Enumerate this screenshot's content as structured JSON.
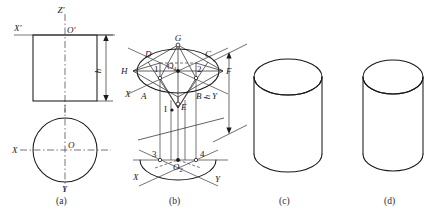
{
  "figure": {
    "kind": "engineering-drawing",
    "background_color": "#ffffff",
    "line_color": "#1a1a1a",
    "thin_line_color": "#3a3a3a"
  },
  "captions": {
    "a": "(a)",
    "b": "(b)",
    "c": "(c)",
    "d": "(d)"
  },
  "panel_a": {
    "name": "orthographic-projection",
    "axis_labels": {
      "z_prime": "Z'",
      "x_prime": "X'",
      "o_prime": "O'",
      "x": "X",
      "y": "Y",
      "o": "O"
    },
    "dimension_label": "h"
  },
  "panel_b": {
    "name": "isometric-construction",
    "axis_labels": {
      "x_upper": "X",
      "y_upper": "Y",
      "x_lower": "X",
      "y_lower": "Y"
    },
    "point_labels": {
      "G": "G",
      "C": "C",
      "D": "D",
      "H": "H",
      "F": "F",
      "A": "A",
      "B": "B",
      "E": "E",
      "I": "I",
      "one": "1",
      "two": "2",
      "three": "3",
      "four": "4",
      "o1": "O",
      "o1_sub": "1",
      "o2": "O",
      "o2_sub": "2"
    },
    "dimension_label": "h"
  },
  "panel_c": {
    "name": "isometric-cylinder-thin",
    "label": "(c)"
  },
  "panel_d": {
    "name": "isometric-cylinder-bold",
    "label": "(d)"
  },
  "footer": {
    "text": ""
  }
}
